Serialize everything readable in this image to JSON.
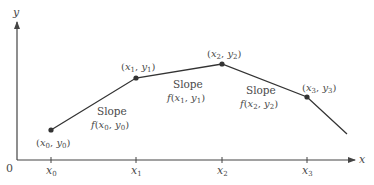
{
  "axes": {
    "x_label": "x",
    "y_label": "y",
    "origin_label": "0",
    "x_ticks": [
      {
        "base": "x",
        "sub": "0"
      },
      {
        "base": "x",
        "sub": "1"
      },
      {
        "base": "x",
        "sub": "2"
      },
      {
        "base": "x",
        "sub": "3"
      }
    ]
  },
  "points": [
    {
      "label_x": "x",
      "sub_x": "0",
      "label_y": "y",
      "sub_y": "0"
    },
    {
      "label_x": "x",
      "sub_x": "1",
      "label_y": "y",
      "sub_y": "1"
    },
    {
      "label_x": "x",
      "sub_x": "2",
      "label_y": "y",
      "sub_y": "2"
    },
    {
      "label_x": "x",
      "sub_x": "3",
      "label_y": "y",
      "sub_y": "3"
    }
  ],
  "slopes": [
    {
      "title": "Slope",
      "fn": "f",
      "x": "x",
      "xs": "0",
      "y": "y",
      "ys": "0"
    },
    {
      "title": "Slope",
      "fn": "f",
      "x": "x",
      "xs": "1",
      "y": "y",
      "ys": "1"
    },
    {
      "title": "Slope",
      "fn": "f",
      "x": "x",
      "xs": "2",
      "y": "y",
      "ys": "2"
    }
  ],
  "colors": {
    "line": "#333333",
    "text": "#4a4a4a",
    "axis": "#444444"
  }
}
